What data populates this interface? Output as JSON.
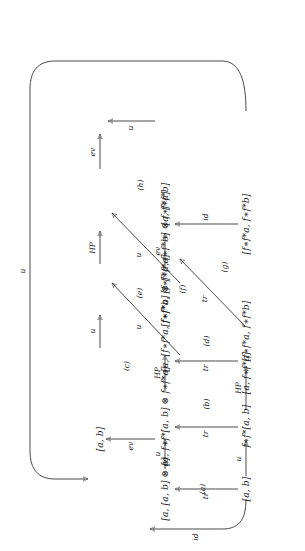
{
  "figure": {
    "type": "commutative-diagram",
    "orientation": "rotated-90-ccw"
  },
  "nodes": {
    "n1": "[a, b]",
    "n2": "[a, [a, b] ⊗ a]",
    "n3": "[a, f∗f*a]",
    "n4": "[a, f∗f*[a, b] ⊗ f∗f*a]",
    "n5": "[a, [f∗f*a, f∗f*b] ⊗ f∗f*a]",
    "n6": "[a, f∗f*b]",
    "n7": "[a, b]",
    "n8": "f∗f*[a, b]",
    "n9": "[f∗f*a, f∗f*b]",
    "n10": "[f∗f*a, [f∗f*a, f∗f*b] ⊗ f∗f*a]",
    "n11": "[f∗f*a, f∗f*b]"
  },
  "arrow_labels": {
    "top_u": "u",
    "left_ev": "ev",
    "left_id": "id",
    "a_tr": "tr",
    "a_u": "u",
    "b_tr": "tr",
    "b_u": "u",
    "c_u": "u",
    "d_tr": "tr",
    "d_hp": "HP",
    "e_u": "u",
    "e_hp": "HP",
    "f_tr": "tr",
    "f_u": "u",
    "g_tr": "tr",
    "h_u": "u",
    "h_ev": "ev",
    "right_ev": "ev",
    "right_id": "id"
  },
  "region_labels": {
    "a": "(a)",
    "b": "(b)",
    "c": "(c)",
    "d": "(d)",
    "e": "(e)",
    "f": "(f)",
    "g": "(g)",
    "h": "(h)"
  },
  "style": {
    "stroke": "#2a2a2a",
    "background": "#ffffff"
  }
}
